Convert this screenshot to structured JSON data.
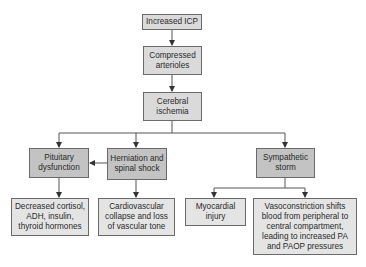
{
  "diagram": {
    "nodes": [
      {
        "id": "increased-icp",
        "label": "Increased ICP"
      },
      {
        "id": "compressed-arterioles",
        "label": "Compressed arterioles"
      },
      {
        "id": "cerebral-ischemia",
        "label": "Cerebral ischemia"
      },
      {
        "id": "pituitary-dysfunction",
        "label": "Pituitary dysfunction"
      },
      {
        "id": "herniation-spinal-shock",
        "label": "Herniation and spinal shock"
      },
      {
        "id": "sympathetic-storm",
        "label": "Sympathetic storm"
      },
      {
        "id": "decreased-hormones",
        "label": "Decreased cortisol, ADH, insulin, thyroid hormones"
      },
      {
        "id": "cardiovascular-collapse",
        "label": "Cardiovascular collapse and loss of vascular tone"
      },
      {
        "id": "myocardial-injury",
        "label": "Myocardial injury"
      },
      {
        "id": "vasoconstriction",
        "label": "Vasoconstriction shifts blood from peripheral to central compartment, leading to increased PA and PAOP pressures"
      }
    ],
    "edges": [
      {
        "from": "increased-icp",
        "to": "compressed-arterioles"
      },
      {
        "from": "compressed-arterioles",
        "to": "cerebral-ischemia"
      },
      {
        "from": "cerebral-ischemia",
        "to": "pituitary-dysfunction"
      },
      {
        "from": "cerebral-ischemia",
        "to": "herniation-spinal-shock"
      },
      {
        "from": "cerebral-ischemia",
        "to": "sympathetic-storm"
      },
      {
        "from": "herniation-spinal-shock",
        "to": "pituitary-dysfunction"
      },
      {
        "from": "pituitary-dysfunction",
        "to": "decreased-hormones"
      },
      {
        "from": "herniation-spinal-shock",
        "to": "cardiovascular-collapse"
      },
      {
        "from": "sympathetic-storm",
        "to": "myocardial-injury"
      },
      {
        "from": "sympathetic-storm",
        "to": "vasoconstriction"
      }
    ]
  }
}
